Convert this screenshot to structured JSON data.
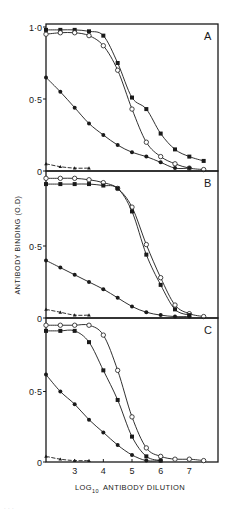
{
  "figure": {
    "ylabel": "ANTIBODY BINDING (O.D)",
    "xlabel_main": "LOG",
    "xlabel_sub": "10",
    "xlabel_rest": "ANTIBODY DILUTION",
    "caption_fragment": "· · ·"
  },
  "chart_data": [
    {
      "type": "line",
      "panel": "A",
      "title": "A",
      "xlabel": "LOG10 ANTIBODY DILUTION",
      "ylabel": "ANTIBODY BINDING (O.D)",
      "xlim": [
        2.0,
        8.0
      ],
      "ylim": [
        0,
        1.0
      ],
      "yticks": [
        "0",
        "0·5",
        "1·0"
      ],
      "grid": false,
      "series": [
        {
          "name": "filled-squares",
          "marker": "square",
          "x": [
            2.0,
            2.5,
            3.0,
            3.5,
            4.0,
            4.5,
            5.0,
            5.5,
            6.0,
            6.5,
            7.0,
            7.5
          ],
          "values": [
            0.98,
            0.98,
            0.98,
            0.97,
            0.94,
            0.75,
            0.51,
            0.43,
            0.26,
            0.15,
            0.1,
            0.07
          ]
        },
        {
          "name": "open-circles",
          "marker": "open-circle",
          "x": [
            2.0,
            2.5,
            3.0,
            3.5,
            4.0,
            4.5,
            5.0,
            5.5,
            6.0,
            6.5,
            7.0,
            7.5
          ],
          "values": [
            0.95,
            0.96,
            0.96,
            0.94,
            0.87,
            0.7,
            0.43,
            0.2,
            0.1,
            0.05,
            0.02,
            0.01
          ]
        },
        {
          "name": "filled-circles",
          "marker": "filled-circle",
          "x": [
            2.0,
            2.5,
            3.0,
            3.5,
            4.0,
            4.5,
            5.0,
            5.5,
            6.0,
            6.5,
            7.0
          ],
          "values": [
            0.65,
            0.55,
            0.44,
            0.33,
            0.25,
            0.18,
            0.13,
            0.1,
            0.06,
            0.02,
            0.02
          ]
        },
        {
          "name": "filled-triangles",
          "marker": "triangle",
          "x": [
            2.0,
            2.5,
            3.0,
            3.5
          ],
          "values": [
            0.05,
            0.03,
            0.02,
            0.02
          ]
        }
      ]
    },
    {
      "type": "line",
      "panel": "B",
      "title": "B",
      "xlim": [
        2.0,
        8.0
      ],
      "ylim": [
        0,
        1.0
      ],
      "yticks": [
        "0",
        "0·5"
      ],
      "grid": false,
      "series": [
        {
          "name": "open-circles",
          "marker": "open-circle",
          "x": [
            2.0,
            2.5,
            3.0,
            3.5,
            4.0,
            4.5,
            5.0,
            5.5,
            6.0,
            6.5,
            7.0,
            7.5
          ],
          "values": [
            0.97,
            0.97,
            0.97,
            0.96,
            0.94,
            0.9,
            0.77,
            0.51,
            0.28,
            0.09,
            0.03,
            0.01
          ]
        },
        {
          "name": "filled-squares",
          "marker": "square",
          "x": [
            2.0,
            2.5,
            3.0,
            3.5,
            4.0,
            4.5,
            5.0,
            5.5,
            6.0,
            6.5,
            7.0
          ],
          "values": [
            0.93,
            0.93,
            0.93,
            0.93,
            0.92,
            0.9,
            0.74,
            0.44,
            0.23,
            0.06,
            0.02
          ]
        },
        {
          "name": "filled-circles",
          "marker": "filled-circle",
          "x": [
            2.0,
            2.5,
            3.0,
            3.5,
            4.0,
            4.5,
            5.0,
            5.5,
            6.0,
            6.5,
            7.0
          ],
          "values": [
            0.4,
            0.35,
            0.3,
            0.25,
            0.2,
            0.14,
            0.08,
            0.04,
            0.02,
            0.01,
            0.01
          ]
        },
        {
          "name": "filled-triangles",
          "marker": "triangle",
          "x": [
            2.0,
            2.5,
            3.0,
            3.5
          ],
          "values": [
            0.06,
            0.04,
            0.02,
            0.02
          ]
        }
      ]
    },
    {
      "type": "line",
      "panel": "C",
      "title": "C",
      "xlim": [
        2.0,
        8.0
      ],
      "ylim": [
        0,
        1.0
      ],
      "yticks": [
        "0",
        "0·5"
      ],
      "xticks": [
        "3",
        "4",
        "5",
        "6",
        "7"
      ],
      "grid": false,
      "series": [
        {
          "name": "open-circles",
          "marker": "open-circle",
          "x": [
            2.0,
            2.5,
            3.0,
            3.5,
            4.0,
            4.5,
            5.0,
            5.5,
            6.0,
            6.5,
            7.0,
            7.5
          ],
          "values": [
            0.97,
            0.97,
            0.97,
            0.97,
            0.9,
            0.65,
            0.32,
            0.1,
            0.04,
            0.02,
            0.02,
            0.01
          ]
        },
        {
          "name": "filled-squares",
          "marker": "square",
          "x": [
            2.0,
            2.5,
            3.0,
            3.5,
            4.0,
            4.5,
            5.0,
            5.5,
            6.0
          ],
          "values": [
            0.93,
            0.93,
            0.93,
            0.85,
            0.65,
            0.44,
            0.18,
            0.04,
            0.01
          ]
        },
        {
          "name": "filled-circles",
          "marker": "filled-circle",
          "x": [
            2.0,
            2.5,
            3.0,
            3.5,
            4.0,
            4.5,
            5.0,
            5.5,
            6.0
          ],
          "values": [
            0.62,
            0.5,
            0.41,
            0.3,
            0.21,
            0.12,
            0.05,
            0.01,
            0.01
          ]
        },
        {
          "name": "filled-triangles",
          "marker": "triangle",
          "x": [
            2.0,
            2.5,
            3.0,
            3.5
          ],
          "values": [
            0.04,
            0.02,
            0.01,
            0.01
          ]
        }
      ]
    }
  ]
}
